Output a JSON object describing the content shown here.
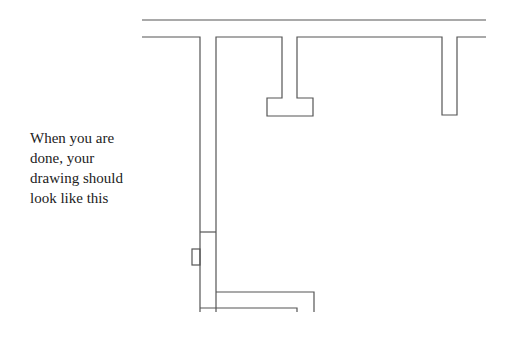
{
  "caption": {
    "lines": [
      "When you are",
      "done, your",
      "drawing should",
      "look like this"
    ]
  },
  "drawing": {
    "stroke_color": "#555555",
    "description": "Floor-plan style line drawing: outer wall line with T-shaped protrusions and an L-shaped corridor"
  }
}
